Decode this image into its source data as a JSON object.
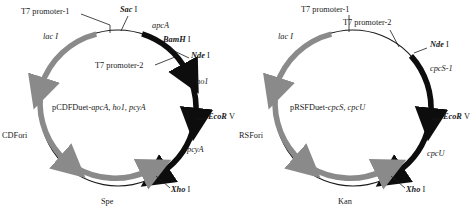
{
  "figure": {
    "type": "plasmid-map-pair",
    "background": "#ffffff",
    "colors": {
      "gene_arc": "#0d0d0d",
      "marker_arc": "#8a8a8a",
      "backbone": "#1a1a1a",
      "text": "#1a1a1a"
    }
  },
  "plasmids": [
    {
      "id": "pCDFDuet",
      "center_label": {
        "prefix": "pCDFDuet-",
        "genes": "apcA, ho1, pcyA",
        "full": "pCDFDuet-apcA, ho1, pcyA"
      },
      "promoters": [
        {
          "name": "T7 promoter-1"
        },
        {
          "name": "T7 promoter-2"
        }
      ],
      "restriction_sites": [
        {
          "enzyme": "Sac",
          "numeral": "I",
          "full": "Sac I"
        },
        {
          "enzyme": "BamH",
          "numeral": "I",
          "full": "BamH I"
        },
        {
          "enzyme": "Nde",
          "numeral": "I",
          "full": "Nde I"
        },
        {
          "enzyme": "EcoR",
          "numeral": "V",
          "full": "EcoR V"
        },
        {
          "enzyme": "Xho",
          "numeral": "I",
          "full": "Xho I"
        }
      ],
      "genes": [
        {
          "name": "apcA",
          "style": "italic",
          "arc": "black"
        },
        {
          "name": "ho1",
          "style": "italic",
          "arc": "black"
        },
        {
          "name": "pcyA",
          "style": "italic",
          "arc": "black"
        }
      ],
      "features": [
        {
          "name": "lac I",
          "style": "italic",
          "arc": "gray"
        },
        {
          "name": "CDFori",
          "style": "roman",
          "arc": "gray"
        },
        {
          "name": "Spe",
          "style": "roman",
          "arc": "gray"
        }
      ]
    },
    {
      "id": "pRSFDuet",
      "center_label": {
        "prefix": "pRSFDuet-",
        "genes": "cpcS, cpcU",
        "full": "pRSFDuet-cpcS, cpcU"
      },
      "promoters": [
        {
          "name": "T7 promoter-1"
        },
        {
          "name": "T7 promoter-2"
        }
      ],
      "restriction_sites": [
        {
          "enzyme": "Nde",
          "numeral": "I",
          "full": "Nde I"
        },
        {
          "enzyme": "EcoR",
          "numeral": "V",
          "full": "EcoR V"
        },
        {
          "enzyme": "Xho",
          "numeral": "I",
          "full": "Xho I"
        }
      ],
      "genes": [
        {
          "name": "cpcS-1",
          "style": "italic",
          "arc": "black"
        },
        {
          "name": "cpcU",
          "style": "italic",
          "arc": "black"
        }
      ],
      "features": [
        {
          "name": "lac I",
          "style": "italic",
          "arc": "gray"
        },
        {
          "name": "RSFori",
          "style": "roman",
          "arc": "gray"
        },
        {
          "name": "Kan",
          "style": "roman",
          "arc": "gray"
        }
      ]
    }
  ]
}
